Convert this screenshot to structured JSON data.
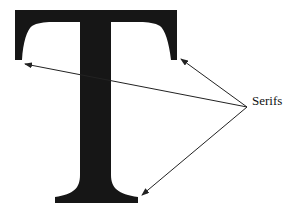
{
  "diagram": {
    "letter": "T",
    "label": "Serifs",
    "colors": {
      "glyph": "#161616",
      "arrow": "#222222",
      "background": "#ffffff"
    },
    "arrows": [
      {
        "target": "left-top-serif",
        "from": [
          247,
          107
        ],
        "to": [
          25,
          64
        ]
      },
      {
        "target": "right-top-serif",
        "from": [
          247,
          107
        ],
        "to": [
          181,
          59
        ]
      },
      {
        "target": "bottom-serif",
        "from": [
          247,
          107
        ],
        "to": [
          142,
          195
        ]
      }
    ]
  }
}
